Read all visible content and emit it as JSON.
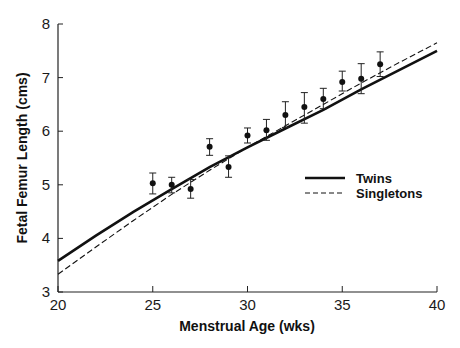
{
  "chart_data": {
    "type": "line",
    "title": "",
    "xlabel": "Menstrual Age (wks)",
    "ylabel": "Fetal Femur Length (cms)",
    "xlim": [
      20,
      40
    ],
    "ylim": [
      3,
      8
    ],
    "xticks": [
      20,
      25,
      30,
      35,
      40
    ],
    "yticks": [
      3,
      4,
      5,
      6,
      7,
      8
    ],
    "grid": false,
    "legend_position": "right-middle",
    "series": [
      {
        "name": "Twins",
        "style": "solid",
        "x": [
          20,
          22,
          24,
          26,
          28,
          30,
          32,
          34,
          36,
          38,
          40
        ],
        "y": [
          3.58,
          4.05,
          4.5,
          4.92,
          5.33,
          5.7,
          6.05,
          6.4,
          6.78,
          7.14,
          7.5
        ]
      },
      {
        "name": "Singletons",
        "style": "dashed",
        "x": [
          20,
          22,
          24,
          26,
          28,
          30,
          32,
          34,
          36,
          38,
          40
        ],
        "y": [
          3.33,
          3.84,
          4.34,
          4.82,
          5.27,
          5.7,
          6.1,
          6.5,
          6.9,
          7.28,
          7.65
        ]
      },
      {
        "name": "Twin observations (mean ± SD)",
        "style": "points-with-errorbars",
        "x": [
          25,
          26,
          27,
          28,
          29,
          30,
          31,
          32,
          33,
          34,
          35,
          36,
          37
        ],
        "y": [
          5.03,
          5.0,
          4.92,
          5.71,
          5.33,
          5.92,
          6.02,
          6.3,
          6.45,
          6.6,
          6.92,
          6.98,
          7.25
        ],
        "err_low": [
          4.83,
          4.85,
          4.75,
          5.55,
          5.14,
          5.78,
          5.83,
          6.07,
          6.15,
          6.42,
          6.75,
          6.7,
          7.02
        ],
        "err_high": [
          5.22,
          5.14,
          5.1,
          5.86,
          5.54,
          6.06,
          6.22,
          6.55,
          6.72,
          6.8,
          7.12,
          7.26,
          7.48
        ]
      }
    ]
  },
  "labels": {
    "xlabel": "Menstrual Age (wks)",
    "ylabel": "Fetal Femur Length (cms)",
    "legend_twins": "Twins",
    "legend_singletons": "Singletons"
  }
}
